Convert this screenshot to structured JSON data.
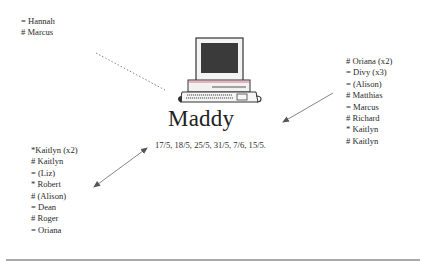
{
  "center": {
    "title": "Maddy",
    "dates": "17/5, 18/5, 25/5, 31/5, 7/6, 15/5.",
    "icon": "computer-icon"
  },
  "groups": {
    "top_left": {
      "items": [
        "= Hannah",
        "# Marcus"
      ],
      "connector": "dotted-line"
    },
    "right": {
      "items": [
        "#  Oriana (x2)",
        "=  Divy (x3)",
        "= (Alison)",
        "#  Matthias",
        "= Marcus",
        "# Richard",
        "* Kaitlyn",
        "# Kaitlyn"
      ],
      "connector": "arrow-to-center"
    },
    "bottom_left": {
      "items": [
        "*Kaitlyn (x2)",
        "# Kaitlyn",
        "= (Liz)",
        "* Robert",
        "#  (Alison)",
        "= Dean",
        "# Roger",
        "= Oriana"
      ],
      "connector": "double-arrow"
    }
  },
  "colors": {
    "text": "#2a2a2a",
    "line": "#6e6e6e",
    "screen": "#3a3a3a",
    "accent_stripe": "#e89aa8"
  }
}
